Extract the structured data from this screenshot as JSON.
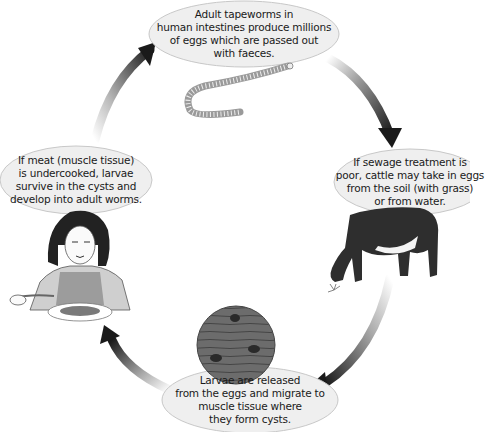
{
  "diagram": {
    "type": "life-cycle",
    "stages": [
      {
        "id": "adult",
        "lines": [
          "Adult tapeworms in",
          "human intestines produce millions",
          "of eggs which are passed out",
          "with faeces."
        ],
        "illustration": "tapeworm"
      },
      {
        "id": "cattle",
        "lines": [
          "If sewage treatment is",
          "poor, cattle may take in eggs",
          "from the soil (with grass)",
          "or from water."
        ],
        "illustration": "cow-grazing"
      },
      {
        "id": "larvae",
        "lines": [
          "Larvae are released",
          "from the eggs and migrate to",
          "muscle tissue where",
          "they form cysts."
        ],
        "illustration": "muscle-tissue-with-cysts"
      },
      {
        "id": "human",
        "lines": [
          "If meat (muscle tissue)",
          "is undercooked, larvae",
          "survive in the cysts and",
          "develop into adult worms."
        ],
        "illustration": "woman-eating-steak"
      }
    ],
    "arrows": [
      {
        "from": "human",
        "to": "adult"
      },
      {
        "from": "adult",
        "to": "cattle"
      },
      {
        "from": "cattle",
        "to": "larvae"
      },
      {
        "from": "larvae",
        "to": "human"
      }
    ],
    "colors": {
      "bubble_fill": "#efefef",
      "bubble_stroke": "#c8c8c8",
      "arrow_dark": "#1a1a1a",
      "cow": "#2e2e2e",
      "muscle": "#6a6a6a",
      "cyst": "#2a2a2a"
    }
  }
}
